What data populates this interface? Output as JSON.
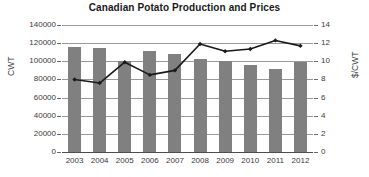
{
  "chart_data": {
    "type": "bar",
    "title": "Canadian Potato Production and Prices",
    "xlabel": "",
    "ylabel": "CWT",
    "y2label": "$/CWT",
    "categories": [
      "2003",
      "2004",
      "2005",
      "2006",
      "2007",
      "2008",
      "2009",
      "2010",
      "2011",
      "2012"
    ],
    "ylim": [
      0,
      140000
    ],
    "y2lim": [
      0,
      14
    ],
    "yticks": [
      "0",
      "20000",
      "40000",
      "60000",
      "80000",
      "100000",
      "120000",
      "140000"
    ],
    "ytick_values": [
      0,
      20000,
      40000,
      60000,
      80000,
      100000,
      120000,
      140000
    ],
    "y2ticks": [
      "0",
      "2",
      "4",
      "6",
      "8",
      "10",
      "12",
      "14"
    ],
    "y2tick_values": [
      0,
      2,
      4,
      6,
      8,
      10,
      12,
      14
    ],
    "grid": true,
    "legend": "none",
    "series": [
      {
        "name": "Production",
        "type": "bar",
        "axis": "left",
        "color": "#808080",
        "values": [
          115500,
          114500,
          100000,
          111000,
          108500,
          102000,
          100000,
          96000,
          91500,
          99500
        ]
      },
      {
        "name": "Price",
        "type": "line",
        "axis": "right",
        "color": "#1a1a1a",
        "marker": "diamond",
        "values": [
          8.0,
          7.6,
          9.9,
          8.5,
          9.0,
          11.9,
          11.1,
          11.35,
          12.3,
          11.7
        ]
      }
    ]
  },
  "colors": {
    "bar": "#808080",
    "line": "#1a1a1a",
    "grid": "#9a9a9a",
    "axis": "#4d4d4d",
    "text": "#3a3a3a",
    "title": "#1a1a1a",
    "background": "#ffffff"
  }
}
